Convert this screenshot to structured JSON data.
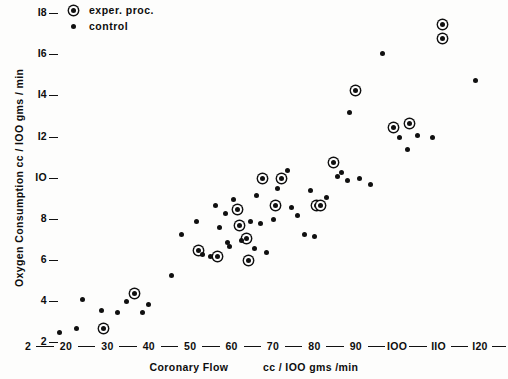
{
  "chart_data": {
    "type": "scatter",
    "title": "",
    "xlabel": "Coronary Flow",
    "xlabel_units": "cc / 100 gms /min",
    "ylabel": "Oxygen Consumption  cc / 100 gms / min",
    "xlim": [
      12,
      120
    ],
    "ylim": [
      2,
      18.6
    ],
    "xticks": [
      20,
      30,
      40,
      50,
      60,
      70,
      80,
      90,
      100,
      110,
      120
    ],
    "yticks": [
      2,
      4,
      6,
      8,
      10,
      12,
      14,
      16,
      18
    ],
    "grid": false,
    "legend_position": "top-left",
    "series": [
      {
        "name": "exper. proc.",
        "marker": "circled-dot",
        "points": [
          [
            36.5,
            4.3
          ],
          [
            29.0,
            2.6
          ],
          [
            56.5,
            6.1
          ],
          [
            52.0,
            6.4
          ],
          [
            61.5,
            8.4
          ],
          [
            62.0,
            7.6
          ],
          [
            63.5,
            7.0
          ],
          [
            64.0,
            5.9
          ],
          [
            67.5,
            9.9
          ],
          [
            70.5,
            8.6
          ],
          [
            72.0,
            9.9
          ],
          [
            80.5,
            8.6
          ],
          [
            81.5,
            8.6
          ],
          [
            84.5,
            10.7
          ],
          [
            90.0,
            14.2
          ],
          [
            99.0,
            12.4
          ],
          [
            103.0,
            12.6
          ],
          [
            111.0,
            17.4
          ],
          [
            111.0,
            16.7
          ]
        ]
      },
      {
        "name": "control",
        "marker": "dot",
        "points": [
          [
            18.5,
            2.4
          ],
          [
            22.5,
            2.6
          ],
          [
            24.0,
            4.0
          ],
          [
            28.5,
            3.5
          ],
          [
            32.5,
            3.4
          ],
          [
            34.5,
            3.9
          ],
          [
            38.5,
            3.4
          ],
          [
            40.0,
            3.8
          ],
          [
            45.5,
            5.2
          ],
          [
            48.0,
            7.2
          ],
          [
            51.5,
            7.8
          ],
          [
            53.0,
            6.2
          ],
          [
            55.0,
            6.1
          ],
          [
            56.0,
            8.6
          ],
          [
            57.0,
            7.5
          ],
          [
            58.5,
            8.2
          ],
          [
            59.0,
            6.8
          ],
          [
            59.5,
            6.6
          ],
          [
            60.5,
            8.9
          ],
          [
            62.5,
            6.9
          ],
          [
            64.5,
            7.8
          ],
          [
            65.5,
            6.5
          ],
          [
            66.0,
            9.1
          ],
          [
            67.0,
            7.7
          ],
          [
            68.5,
            6.3
          ],
          [
            70.0,
            7.9
          ],
          [
            71.0,
            9.4
          ],
          [
            73.5,
            10.3
          ],
          [
            74.5,
            8.5
          ],
          [
            76.0,
            8.1
          ],
          [
            77.5,
            7.2
          ],
          [
            79.0,
            9.3
          ],
          [
            80.0,
            7.1
          ],
          [
            83.0,
            9.0
          ],
          [
            85.5,
            10.0
          ],
          [
            86.5,
            10.2
          ],
          [
            88.0,
            9.8
          ],
          [
            88.5,
            13.1
          ],
          [
            91.0,
            9.9
          ],
          [
            93.5,
            9.6
          ],
          [
            96.5,
            16.0
          ],
          [
            100.5,
            11.9
          ],
          [
            102.5,
            11.3
          ],
          [
            105.0,
            12.0
          ],
          [
            108.5,
            11.9
          ],
          [
            119.0,
            14.7
          ]
        ]
      }
    ]
  },
  "legend": {
    "items": [
      {
        "label": "exper. proc.",
        "marker": "circled-dot"
      },
      {
        "label": "control",
        "marker": "dot"
      }
    ]
  },
  "axes": {
    "y_title": "Oxygen  Consumption   cc / IOO gms / min",
    "x_title_left": "Coronary  Flow",
    "x_title_right": "cc / IOO gms /min",
    "y_tick_labels": [
      "2",
      "4",
      "6",
      "8",
      "IO",
      "I2",
      "I4",
      "I6",
      "I8"
    ],
    "x_tick_labels": [
      "20",
      "30",
      "40",
      "50",
      "60",
      "70",
      "80",
      "90",
      "IOO",
      "IIO",
      "I20"
    ]
  }
}
